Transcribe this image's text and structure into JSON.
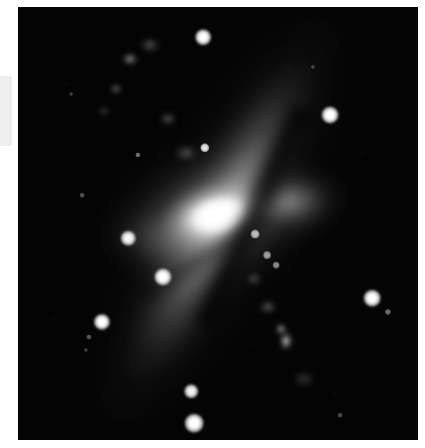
{
  "image": {
    "kind": "astronomical-photograph",
    "subject": "starburst-galaxy",
    "plate": {
      "background_color": "#040404",
      "left": 18,
      "top": 7,
      "width": 400,
      "height": 433
    },
    "page_background_color": "#ffffff",
    "gutter_bar_color": "#eeeeee"
  },
  "chart_data": {
    "type": "scatter",
    "title": "",
    "xlabel": "",
    "ylabel": "",
    "grid": false,
    "legend": null,
    "xlim": [
      0,
      400
    ],
    "ylim": [
      0,
      433
    ],
    "note": "Greyscale sky plate: inclined disk galaxy with bright starburst nucleus and a dark dust lane, plus foreground field stars. Coordinates are plate-local pixels; brightness is a 0-1 relative intensity.",
    "series": [
      {
        "name": "field-stars",
        "points": [
          {
            "id": "star-1",
            "x": 185,
            "y": 30,
            "r": 6.0,
            "brightness": 1.0
          },
          {
            "id": "star-2",
            "x": 312,
            "y": 108,
            "r": 6.5,
            "brightness": 1.0
          },
          {
            "id": "star-3",
            "x": 187,
            "y": 141,
            "r": 3.6,
            "brightness": 0.88
          },
          {
            "id": "star-4",
            "x": 120,
            "y": 148,
            "r": 2.0,
            "brightness": 0.45
          },
          {
            "id": "star-5",
            "x": 64,
            "y": 188,
            "r": 1.8,
            "brightness": 0.32
          },
          {
            "id": "star-6",
            "x": 110,
            "y": 231,
            "r": 5.6,
            "brightness": 0.96
          },
          {
            "id": "star-7",
            "x": 237,
            "y": 227,
            "r": 3.4,
            "brightness": 0.7
          },
          {
            "id": "star-8",
            "x": 145,
            "y": 270,
            "r": 6.6,
            "brightness": 1.0
          },
          {
            "id": "star-9",
            "x": 84,
            "y": 315,
            "r": 6.2,
            "brightness": 1.0
          },
          {
            "id": "star-10",
            "x": 71,
            "y": 330,
            "r": 2.0,
            "brightness": 0.35
          },
          {
            "id": "star-11",
            "x": 354,
            "y": 291,
            "r": 6.4,
            "brightness": 1.0
          },
          {
            "id": "star-12",
            "x": 370,
            "y": 305,
            "r": 2.4,
            "brightness": 0.42
          },
          {
            "id": "star-13",
            "x": 173,
            "y": 384,
            "r": 5.2,
            "brightness": 0.95
          },
          {
            "id": "star-14",
            "x": 176,
            "y": 416,
            "r": 7.2,
            "brightness": 1.0
          },
          {
            "id": "star-15",
            "x": 295,
            "y": 60,
            "r": 1.6,
            "brightness": 0.25
          },
          {
            "id": "star-16",
            "x": 53,
            "y": 87,
            "r": 1.5,
            "brightness": 0.22
          },
          {
            "id": "star-17",
            "x": 249,
            "y": 248,
            "r": 3.0,
            "brightness": 0.6
          },
          {
            "id": "star-18",
            "x": 258,
            "y": 258,
            "r": 2.6,
            "brightness": 0.52
          },
          {
            "id": "star-19",
            "x": 322,
            "y": 408,
            "r": 1.8,
            "brightness": 0.28
          },
          {
            "id": "star-20",
            "x": 68,
            "y": 343,
            "r": 1.6,
            "brightness": 0.24
          }
        ]
      },
      {
        "name": "galaxy-structure",
        "components": [
          {
            "id": "nucleus",
            "x": 183,
            "y": 201,
            "brightness": 1.0,
            "shape": "ellipse",
            "angle_deg": -12
          },
          {
            "id": "core-inner",
            "x": 181,
            "y": 202,
            "brightness": 0.92,
            "shape": "ellipse",
            "angle_deg": -12
          },
          {
            "id": "core-halo",
            "x": 179,
            "y": 201,
            "brightness": 0.55,
            "shape": "ellipse",
            "angle_deg": -8
          },
          {
            "id": "west-lobe",
            "x": 254,
            "y": 188,
            "brightness": 0.52,
            "shape": "ellipse",
            "angle_deg": -6
          },
          {
            "id": "east-fan",
            "x": 132,
            "y": 225,
            "brightness": 0.35,
            "shape": "ellipse",
            "angle_deg": 6
          },
          {
            "id": "disk-band",
            "x": 182,
            "y": 212,
            "brightness": 0.4,
            "shape": "band",
            "angle_deg": 28
          },
          {
            "id": "dust-lane-main",
            "x": 218,
            "y": 203,
            "brightness": 0.0,
            "shape": "band",
            "angle_deg": 24
          },
          {
            "id": "dust-lane-sub",
            "x": 170,
            "y": 243,
            "brightness": 0.0,
            "shape": "band",
            "angle_deg": 58
          }
        ]
      }
    ]
  }
}
